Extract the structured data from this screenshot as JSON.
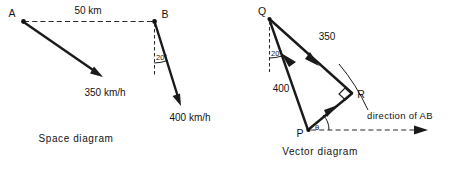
{
  "figure": {
    "kind": "mechanics-vector-figure",
    "ink_color": "#1a1a1a",
    "background_color": "#ffffff"
  },
  "space_diagram": {
    "caption": "Space diagram",
    "points": {
      "a_label": "A",
      "b_label": "B"
    },
    "baseline": {
      "label": "50 km",
      "style": "dashed",
      "from": "A",
      "to": "B"
    },
    "vectors": [
      {
        "id": "a-velocity",
        "label": "350 km/h",
        "origin": "A",
        "heading": "down-right"
      },
      {
        "id": "b-velocity",
        "label": "400 km/h",
        "origin": "B",
        "heading": "down-right-steep"
      }
    ],
    "angles": [
      {
        "id": "angle-at-b",
        "label": "20°",
        "vertex": "B",
        "between": "vertical-dashed-reference and 400 km/h vector"
      }
    ],
    "reference_lines": [
      {
        "id": "b-vertical-reference",
        "style": "dashed",
        "from": "B",
        "direction": "vertical-down"
      }
    ]
  },
  "vector_diagram": {
    "caption": "Vector diagram",
    "points": {
      "q_label": "Q",
      "p_label": "P",
      "r_label": "R"
    },
    "vectors": [
      {
        "id": "qr-vector",
        "label": "350",
        "from": "Q",
        "to": "R",
        "arrow_at": "mid-toward-R"
      },
      {
        "id": "pq-vector",
        "label": "400",
        "from": "P",
        "to": "Q",
        "arrow_at": "mid-toward-Q"
      },
      {
        "id": "pr-vector",
        "label": "",
        "from": "P",
        "to": "R",
        "arrow_at": "mid-toward-R"
      }
    ],
    "angles": [
      {
        "id": "angle-at-q",
        "label": "20°",
        "vertex": "Q",
        "between": "vertical-dashed-reference and PQ"
      },
      {
        "id": "angle-at-p",
        "label": "θ",
        "vertex": "P",
        "between": "direction of AB and PR"
      },
      {
        "id": "right-angle-at-r",
        "label": "",
        "vertex": "R",
        "marker": "right-angle-square"
      }
    ],
    "reference_lines": [
      {
        "id": "q-vertical-reference",
        "style": "dashed",
        "from": "Q",
        "direction": "vertical-down"
      },
      {
        "id": "direction-of-ab-line",
        "style": "dashed-with-arrowhead",
        "label": "direction of AB",
        "from": "P",
        "direction": "horizontal-right"
      }
    ],
    "construction_arc": {
      "id": "locus-arc-through-r",
      "description": "arc passing through R"
    }
  }
}
